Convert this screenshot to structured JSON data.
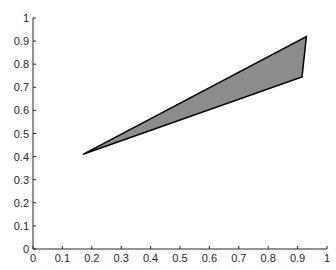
{
  "chart_data": {
    "type": "area",
    "title": "",
    "xlabel": "",
    "ylabel": "",
    "xlim": [
      0,
      1
    ],
    "ylim": [
      0,
      1
    ],
    "grid": false,
    "x_ticks": [
      "0",
      "0.1",
      "0.2",
      "0.3",
      "0.4",
      "0.5",
      "0.6",
      "0.7",
      "0.8",
      "0.9",
      "1"
    ],
    "y_ticks": [
      "0",
      "0.1",
      "0.2",
      "0.3",
      "0.4",
      "0.5",
      "0.6",
      "0.7",
      "0.8",
      "0.9",
      "1"
    ],
    "series": [
      {
        "name": "filled-triangle",
        "shape": "polygon",
        "fill": "#8c8c8c",
        "edge": "#000000",
        "points": [
          {
            "x": 0.17,
            "y": 0.41
          },
          {
            "x": 0.93,
            "y": 0.92
          },
          {
            "x": 0.915,
            "y": 0.745
          }
        ]
      }
    ]
  },
  "colors": {
    "axis": "#262626",
    "fill": "#8c8c8c",
    "edge": "#000000",
    "background": "#ffffff"
  }
}
